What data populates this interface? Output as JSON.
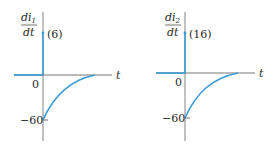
{
  "colors": {
    "curve": "#3a9bd5",
    "axis": "#555555",
    "text": "#2a2a2a"
  },
  "graphs": [
    {
      "id": "graph-1",
      "ylabel_num": "di",
      "ylabel_sub": "1",
      "ylabel_den": "dt",
      "impulse_label": "(6)",
      "zero_label": "0",
      "min_label": "−60",
      "xlabel": "t"
    },
    {
      "id": "graph-2",
      "ylabel_num": "di",
      "ylabel_sub": "2",
      "ylabel_den": "dt",
      "impulse_label": "(16)",
      "zero_label": "0",
      "min_label": "−60",
      "xlabel": "t"
    }
  ]
}
